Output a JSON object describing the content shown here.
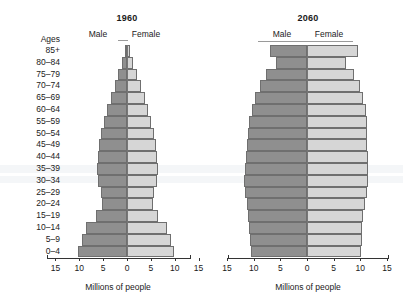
{
  "figure": {
    "axis_caption": "Millions of people",
    "ages_header": "Ages",
    "male_label": "Male",
    "female_label": "Female",
    "male_color": "#8f8f8f",
    "female_color": "#d6d6d6",
    "tick_labels": [
      "15",
      "10",
      "5",
      "0",
      "5",
      "10",
      "15"
    ]
  },
  "chart_data": [
    {
      "type": "bar",
      "title": "1960",
      "subtype": "population-pyramid",
      "xlabel": "Millions of people",
      "ylabel": "Ages",
      "xlim": [
        -15,
        15
      ],
      "xticks": [
        15,
        10,
        5,
        0,
        5,
        10,
        15
      ],
      "grid": false,
      "legend": [
        "Male",
        "Female"
      ],
      "legend_position": "top",
      "categories": [
        "0–4",
        "5–9",
        "10–14",
        "15–19",
        "20–24",
        "25–29",
        "30–34",
        "35–39",
        "40–44",
        "45–49",
        "50–54",
        "55–59",
        "60–64",
        "65–69",
        "70–74",
        "75–79",
        "80–84",
        "85+"
      ],
      "series": [
        {
          "name": "Male",
          "values": [
            10.3,
            9.5,
            8.6,
            6.6,
            5.3,
            5.5,
            6.1,
            6.3,
            6.1,
            5.9,
            5.4,
            4.8,
            4.1,
            3.4,
            2.6,
            1.8,
            1.0,
            0.4
          ]
        },
        {
          "name": "Female",
          "values": [
            9.9,
            9.2,
            8.3,
            6.5,
            5.4,
            5.6,
            6.2,
            6.5,
            6.3,
            6.1,
            5.6,
            5.0,
            4.4,
            3.8,
            3.0,
            2.2,
            1.3,
            0.6
          ]
        }
      ]
    },
    {
      "type": "bar",
      "title": "2060",
      "subtype": "population-pyramid",
      "xlabel": "Millions of people",
      "ylabel": "Ages",
      "xlim": [
        -15,
        15
      ],
      "xticks": [
        15,
        10,
        5,
        0,
        5,
        10,
        15
      ],
      "grid": false,
      "legend": [
        "Male",
        "Female"
      ],
      "legend_position": "top",
      "categories": [
        "0–4",
        "5–9",
        "10–14",
        "15–19",
        "20–24",
        "25–29",
        "30–34",
        "35–39",
        "40–44",
        "45–49",
        "50–54",
        "55–59",
        "60–64",
        "65–69",
        "70–74",
        "75–79",
        "80–84",
        "85+"
      ],
      "series": [
        {
          "name": "Male",
          "values": [
            10.6,
            10.7,
            10.9,
            11.0,
            11.2,
            11.6,
            11.8,
            11.7,
            11.5,
            11.3,
            11.1,
            10.8,
            10.4,
            9.8,
            8.8,
            7.6,
            5.9,
            7.0
          ]
        },
        {
          "name": "Female",
          "values": [
            10.2,
            10.3,
            10.4,
            10.6,
            10.8,
            11.2,
            11.5,
            11.5,
            11.4,
            11.3,
            11.3,
            11.2,
            11.0,
            10.6,
            9.9,
            8.9,
            7.3,
            9.5
          ]
        }
      ]
    }
  ]
}
